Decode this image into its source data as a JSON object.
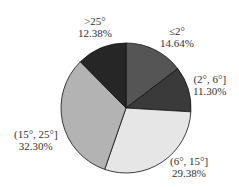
{
  "chart_data": {
    "type": "pie",
    "title": "",
    "categories": [
      "≤2°",
      "(2°, 6°]",
      "(6°, 15°]",
      "(15°, 25°]",
      ">25°"
    ],
    "values": [
      14.64,
      11.3,
      29.38,
      32.3,
      12.38
    ],
    "value_labels": [
      "14.64%",
      "11.30%",
      "29.38%",
      "32.30%",
      "12.38%"
    ],
    "colors": [
      "#555555",
      "#3a3a3a",
      "#e6e6e6",
      "#b3b3b3",
      "#262626"
    ],
    "start_angle_deg": 0,
    "direction": "clockwise",
    "legend": "none"
  }
}
